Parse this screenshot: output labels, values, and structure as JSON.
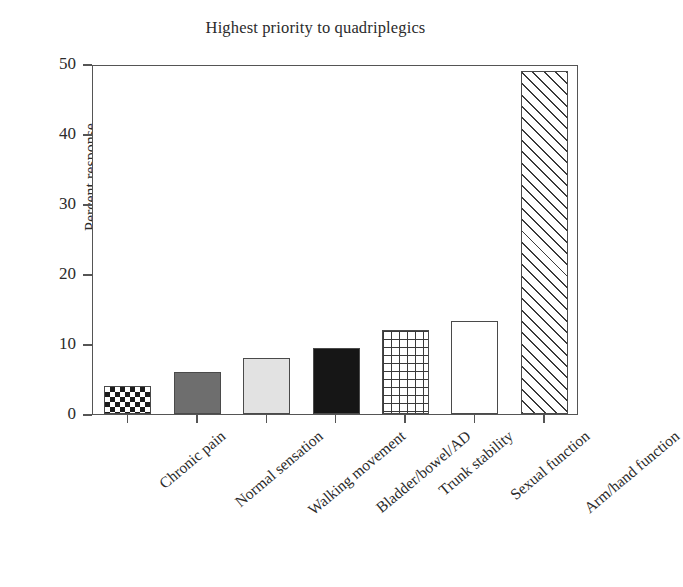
{
  "chart_data": {
    "type": "bar",
    "title": "Highest priority to quadriplegics",
    "xlabel": "",
    "ylabel": "Percent response",
    "ylim": [
      0,
      50
    ],
    "yticks": [
      0,
      10,
      20,
      30,
      40,
      50
    ],
    "ytick_labels": [
      "0",
      "10",
      "20",
      "30",
      "40",
      "50"
    ],
    "grid": false,
    "legend": "none",
    "categories": [
      "Chronic pain",
      "Normal sensation",
      "Walking movement",
      "Bladder/bowel/AD",
      "Trunk stability",
      "Sexual function",
      "Arm/hand function"
    ],
    "values": [
      4,
      6,
      8,
      9.4,
      12,
      13.3,
      49
    ],
    "bar_fills": [
      "checkerboard",
      "solid-gray",
      "solid-light-gray",
      "solid-black",
      "grid-crosshatch",
      "white-empty",
      "diagonal-hatch"
    ],
    "colors": {
      "axis": "#555555",
      "text": "#2b2b2b",
      "bar_gray": "#6e6e6e",
      "bar_light_gray": "#e2e2e2",
      "bar_black": "#161616",
      "bar_white": "#ffffff",
      "hatch": "#3a3a3a",
      "background": "#ffffff"
    }
  }
}
